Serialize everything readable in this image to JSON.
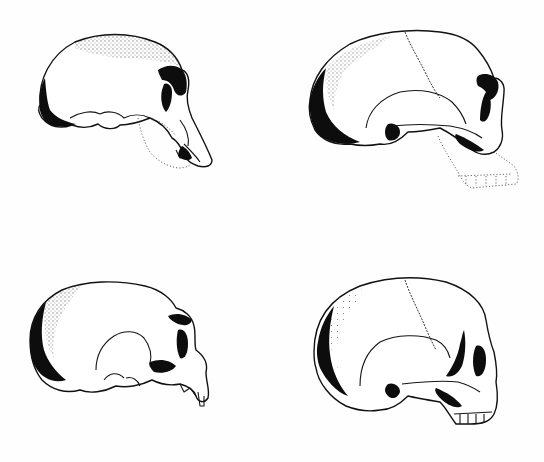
{
  "figure": {
    "background_color": "#ffffff",
    "ink_color": "#111111",
    "panels": [
      {
        "id": "top-left",
        "subject": "skull-lateral-view",
        "reconstructed_mandible": true
      },
      {
        "id": "top-right",
        "subject": "skull-lateral-view",
        "reconstructed_mandible": true
      },
      {
        "id": "bottom-left",
        "subject": "skull-lateral-view",
        "reconstructed_mandible": false
      },
      {
        "id": "bottom-right",
        "subject": "skull-lateral-view",
        "reconstructed_mandible": false
      }
    ]
  }
}
